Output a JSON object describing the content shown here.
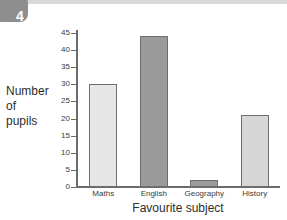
{
  "page": {
    "question_number": "4",
    "badge_color": "#8e8e8e"
  },
  "chart_data": {
    "type": "bar",
    "title": "",
    "xlabel": "Favourite subject",
    "ylabel": "Number of pupils",
    "ylabel_lines": [
      "Number",
      "of",
      "pupils"
    ],
    "categories": [
      "Maths",
      "English",
      "Geography",
      "History"
    ],
    "values": [
      30,
      44,
      2,
      21
    ],
    "ylim": [
      0,
      45
    ],
    "ytick_labels": [
      "45",
      "40",
      "35",
      "30",
      "25",
      "20",
      "15",
      "10",
      "5",
      "0"
    ],
    "ytick_values": [
      45,
      40,
      35,
      30,
      25,
      20,
      15,
      10,
      5,
      0
    ],
    "ytick_step": 5,
    "grid": false,
    "legend": "none",
    "bar_colors": [
      "#e6e6e6",
      "#9b9b9b",
      "#9b9b9b",
      "#d6d6d6"
    ],
    "bar_border_color": "#6e6e6e",
    "axis_color": "#6b6b6b"
  }
}
